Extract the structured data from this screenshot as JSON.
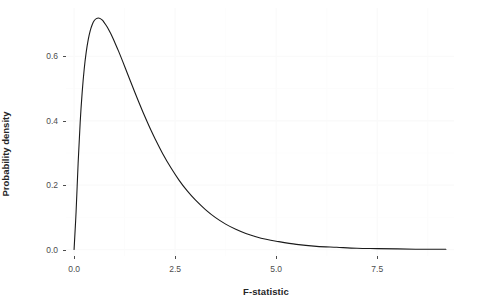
{
  "chart_data": {
    "type": "line",
    "title": "",
    "subtitle": "",
    "xlabel": "F-statistic",
    "ylabel": "Probability density",
    "xlim": [
      -0.2,
      9.4
    ],
    "ylim": [
      -0.02,
      0.75
    ],
    "xticks": [
      0.0,
      2.5,
      5.0,
      7.5
    ],
    "xticklabels": [
      "0.0",
      "2.5",
      "5.0",
      "7.5"
    ],
    "yticks": [
      0.0,
      0.2,
      0.4,
      0.6
    ],
    "yticklabels": [
      "0.0",
      "0.2",
      "0.4",
      "0.6"
    ],
    "grid": true,
    "grid_color": "#fafafa",
    "legend": null,
    "line_color": "#1a1a1a",
    "line_width": 1.1,
    "panel_background": "#ffffff",
    "series": [
      {
        "name": "F density",
        "x": [
          0.0,
          0.05,
          0.1,
          0.15,
          0.2,
          0.25,
          0.3,
          0.35,
          0.4,
          0.45,
          0.5,
          0.55,
          0.6,
          0.65,
          0.7,
          0.75,
          0.8,
          0.85,
          0.9,
          0.95,
          1.0,
          1.1,
          1.2,
          1.3,
          1.4,
          1.5,
          1.6,
          1.7,
          1.8,
          1.9,
          2.0,
          2.2,
          2.4,
          2.6,
          2.8,
          3.0,
          3.25,
          3.5,
          3.75,
          4.0,
          4.25,
          4.5,
          4.75,
          5.0,
          5.5,
          6.0,
          6.5,
          7.0,
          7.5,
          8.0,
          8.5,
          9.0,
          9.2
        ],
        "y": [
          0.0,
          0.118,
          0.268,
          0.393,
          0.488,
          0.56,
          0.613,
          0.652,
          0.68,
          0.699,
          0.711,
          0.717,
          0.719,
          0.717,
          0.712,
          0.704,
          0.695,
          0.684,
          0.672,
          0.659,
          0.645,
          0.616,
          0.585,
          0.553,
          0.521,
          0.489,
          0.458,
          0.428,
          0.399,
          0.371,
          0.345,
          0.296,
          0.253,
          0.215,
          0.182,
          0.154,
          0.124,
          0.099,
          0.079,
          0.063,
          0.05,
          0.04,
          0.032,
          0.026,
          0.016,
          0.01,
          0.007,
          0.004,
          0.003,
          0.002,
          0.001,
          0.001,
          0.001
        ]
      }
    ],
    "peak": {
      "x": 0.6,
      "y": 0.719
    }
  },
  "axes": {
    "x": {
      "title": "F-statistic",
      "ticks": [
        {
          "value": "0.0",
          "pos": 0.0
        },
        {
          "value": "2.5",
          "pos": 2.5
        },
        {
          "value": "5.0",
          "pos": 5.0
        },
        {
          "value": "7.5",
          "pos": 7.5
        }
      ]
    },
    "y": {
      "title": "Probability density",
      "ticks": [
        {
          "value": "0.0",
          "pos": 0.0
        },
        {
          "value": "0.2",
          "pos": 0.2
        },
        {
          "value": "0.4",
          "pos": 0.4
        },
        {
          "value": "0.6",
          "pos": 0.6
        }
      ]
    }
  }
}
